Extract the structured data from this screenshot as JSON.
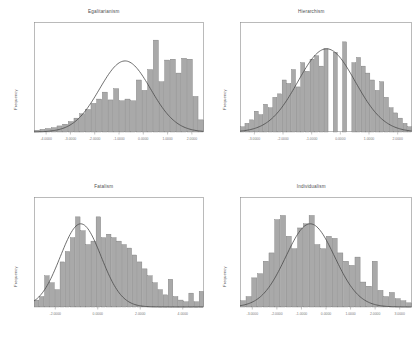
{
  "figure": {
    "layout": "2x2 grid of histograms with fitted normal curves",
    "background_color": "#ffffff",
    "bar_fill_color": "#a9a9a9",
    "bar_edge_color": "#6f6f6f",
    "curve_color": "#4a4a4a",
    "frame_color": "#8c8c8c",
    "text_color": "#4d4d4d"
  },
  "chart_data": [
    {
      "type": "bar",
      "title": "Egalitarianism",
      "xlabel": "",
      "ylabel": "Frequency",
      "grid": false,
      "legend": null,
      "xlim": [
        -4.0,
        3.0
      ],
      "ylim": [
        0,
        120
      ],
      "xticks": [
        "-4.0000",
        "-3.0000",
        "-2.0000",
        "-1.0000",
        "0.0000",
        "1.0000",
        "2.0000"
      ],
      "yticks": [
        "0",
        "20",
        "40",
        "60",
        "80",
        "100",
        "120"
      ],
      "overlay_curve": {
        "kind": "normal",
        "mean": -0.25,
        "sigma": 1.05,
        "peak_value": 82
      },
      "bin_centers": [
        -3.55,
        -3.35,
        -3.15,
        -2.95,
        -2.75,
        -2.55,
        -2.35,
        -2.15,
        -1.95,
        -1.75,
        -1.55,
        -1.35,
        -1.15,
        -0.95,
        -0.75,
        -0.55,
        -0.35,
        -0.15,
        0.05,
        0.25,
        0.45,
        0.65,
        0.85,
        1.05,
        1.25,
        1.45,
        1.65,
        1.85,
        2.05
      ],
      "values": [
        2,
        3,
        4,
        5,
        7,
        9,
        12,
        16,
        21,
        26,
        33,
        38,
        46,
        37,
        50,
        36,
        38,
        36,
        60,
        48,
        72,
        106,
        58,
        83,
        84,
        68,
        85,
        84,
        41,
        14
      ]
    },
    {
      "type": "bar",
      "title": "Hierarchism",
      "xlabel": "",
      "ylabel": "Frequency",
      "grid": false,
      "legend": null,
      "xlim": [
        -3.0,
        3.0
      ],
      "ylim": [
        0,
        60
      ],
      "xticks": [
        "-3.0000",
        "-2.0000",
        "-1.0000",
        "0.0000",
        "1.0000",
        "2.0000"
      ],
      "yticks": [
        "0",
        "20",
        "40",
        "60"
      ],
      "overlay_curve": {
        "kind": "normal",
        "mean": 0.02,
        "sigma": 1.0,
        "peak_value": 48
      },
      "bin_centers": [
        -2.6,
        -2.4,
        -2.2,
        -2.0,
        -1.8,
        -1.6,
        -1.4,
        -1.2,
        -1.0,
        -0.8,
        -0.6,
        -0.4,
        -0.2,
        0.0,
        0.2,
        0.4,
        0.6,
        0.8,
        1.0,
        1.2,
        1.4,
        1.6,
        1.8,
        2.0,
        2.2,
        2.4
      ],
      "values": [
        3,
        5,
        7,
        12,
        10,
        16,
        14,
        20,
        22,
        30,
        28,
        36,
        26,
        40,
        35,
        42,
        44,
        38,
        48,
        0,
        46,
        0,
        52,
        0,
        40,
        43,
        38,
        34,
        30,
        24,
        29,
        20,
        14,
        11,
        8,
        5,
        3
      ]
    },
    {
      "type": "bar",
      "title": "Fatalism",
      "xlabel": "",
      "ylabel": "Frequency",
      "grid": false,
      "legend": null,
      "xlim": [
        -2.0,
        4.0
      ],
      "ylim": [
        0,
        60
      ],
      "xticks": [
        "-2.0000",
        "0.0000",
        "2.0000",
        "4.0000"
      ],
      "yticks": [
        "0",
        "20",
        "40",
        "60"
      ],
      "overlay_curve": {
        "kind": "normal",
        "mean": -0.35,
        "sigma": 0.72,
        "peak_value": 48
      },
      "bin_centers": [
        -1.9,
        -1.75,
        -1.6,
        -1.45,
        -1.3,
        -1.15,
        -1.0,
        -0.85,
        -0.7,
        -0.55,
        -0.4,
        -0.25,
        -0.1,
        0.05,
        0.2,
        0.35,
        0.5,
        0.65,
        0.8,
        0.95,
        1.1,
        1.4,
        1.7,
        2.0,
        2.6,
        3.2
      ],
      "values": [
        4,
        6,
        18,
        14,
        10,
        26,
        32,
        40,
        52,
        44,
        36,
        38,
        52,
        40,
        42,
        40,
        38,
        36,
        34,
        30,
        26,
        22,
        18,
        14,
        10,
        7,
        16,
        6,
        4,
        3,
        8,
        3,
        9
      ],
      "annotation": "long right tail with sparse isolated bars"
    },
    {
      "type": "bar",
      "title": "Individualism",
      "xlabel": "",
      "ylabel": "Frequency",
      "grid": false,
      "legend": null,
      "xlim": [
        -3.0,
        3.0
      ],
      "ylim": [
        0,
        50
      ],
      "xticks": [
        "-3.0000",
        "-2.0000",
        "-1.0000",
        "0.0000",
        "1.0000",
        "2.0000",
        "3.0000"
      ],
      "yticks": [
        "0",
        "10",
        "20",
        "30",
        "40",
        "50"
      ],
      "overlay_curve": {
        "kind": "normal",
        "mean": -0.55,
        "sigma": 0.85,
        "peak_value": 40
      },
      "bin_centers": [
        -2.7,
        -2.5,
        -2.3,
        -2.1,
        -1.9,
        -1.7,
        -1.5,
        -1.3,
        -1.1,
        -0.9,
        -0.7,
        -0.5,
        -0.3,
        -0.1,
        0.1,
        0.3,
        0.5,
        0.7,
        0.9,
        1.1,
        1.4,
        1.7,
        2.0,
        2.3
      ],
      "values": [
        3,
        5,
        14,
        16,
        22,
        26,
        42,
        44,
        34,
        28,
        38,
        40,
        44,
        30,
        28,
        34,
        33,
        26,
        22,
        20,
        24,
        12,
        10,
        22,
        8,
        5,
        7,
        4,
        3,
        2
      ],
      "annotation": "right skewed with small isolated bars in right tail"
    }
  ]
}
